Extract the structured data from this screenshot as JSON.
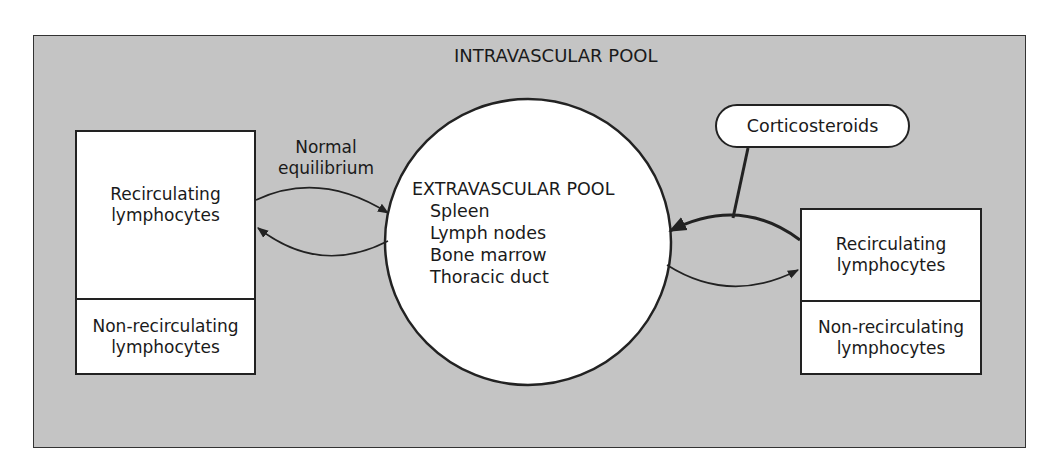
{
  "title": "INTRAVASCULAR POOL",
  "normal_equilibrium": {
    "line1": "Normal",
    "line2": "equilibrium"
  },
  "left_box": {
    "top": {
      "line1": "Recirculating",
      "line2": "lymphocytes"
    },
    "bottom": {
      "line1": "Non-recirculating",
      "line2": "lymphocytes"
    }
  },
  "extravascular_pool": {
    "title": "EXTRAVASCULAR POOL",
    "items": [
      "Spleen",
      "Lymph nodes",
      "Bone marrow",
      "Thoracic duct"
    ]
  },
  "drug": {
    "label": "Corticosteroids"
  },
  "right_box": {
    "top": {
      "line1": "Recirculating",
      "line2": "lymphocytes"
    },
    "bottom": {
      "line1": "Non-recirculating",
      "line2": "lymphocytes"
    }
  },
  "colors": {
    "background_pool": "#c4c4c4",
    "box_fill": "#ffffff",
    "stroke": "#222222"
  }
}
